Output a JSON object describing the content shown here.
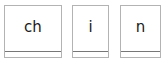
{
  "strip": {
    "name": "grapheme-card-strip",
    "background_color": "#ffffff",
    "card_border_color": "#b3b3b3",
    "card_divider_color": "#777777",
    "letter_color": "#1a1a1a",
    "card_count": 3
  },
  "cards": [
    {
      "label": "ch",
      "width_class": "card-w-wide",
      "name": "grapheme-card-ch"
    },
    {
      "label": "i",
      "width_class": "card-w-narrow",
      "name": "grapheme-card-i"
    },
    {
      "label": "n",
      "width_class": "card-w-mid",
      "name": "grapheme-card-n"
    }
  ],
  "word": "chin"
}
